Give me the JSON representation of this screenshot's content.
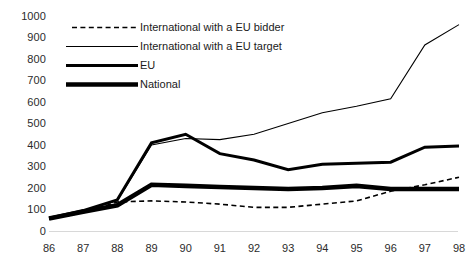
{
  "chart_data": {
    "type": "line",
    "title": "",
    "xlabel": "",
    "ylabel": "",
    "ylim": [
      0,
      1000
    ],
    "ytick_step": 100,
    "grid": false,
    "legend_position": "top-left",
    "categories": [
      "86",
      "87",
      "88",
      "89",
      "90",
      "91",
      "92",
      "93",
      "94",
      "95",
      "96",
      "97",
      "98"
    ],
    "yticks": [
      "1000",
      "900",
      "800",
      "700",
      "600",
      "500",
      "400",
      "300",
      "200",
      "100",
      "0"
    ],
    "series": [
      {
        "name": "International with a EU bidder",
        "style": "dashed-thin",
        "color": "#000000",
        "values": [
          55,
          85,
          135,
          140,
          135,
          125,
          110,
          110,
          125,
          140,
          185,
          215,
          250
        ]
      },
      {
        "name": "International with a EU target",
        "style": "solid-thin",
        "color": "#000000",
        "values": [
          60,
          95,
          140,
          400,
          430,
          425,
          450,
          500,
          550,
          580,
          615,
          865,
          960
        ]
      },
      {
        "name": "EU",
        "style": "solid-medium",
        "color": "#000000",
        "values": [
          60,
          95,
          145,
          410,
          450,
          360,
          330,
          285,
          310,
          315,
          320,
          390,
          395
        ]
      },
      {
        "name": "National",
        "style": "solid-thick",
        "color": "#000000",
        "values": [
          58,
          90,
          120,
          215,
          210,
          205,
          200,
          195,
          200,
          210,
          195,
          195,
          195
        ]
      }
    ]
  },
  "legend": {
    "items": [
      {
        "label": "International with a EU bidder"
      },
      {
        "label": "International with a EU target"
      },
      {
        "label": "EU"
      },
      {
        "label": "National"
      }
    ]
  }
}
